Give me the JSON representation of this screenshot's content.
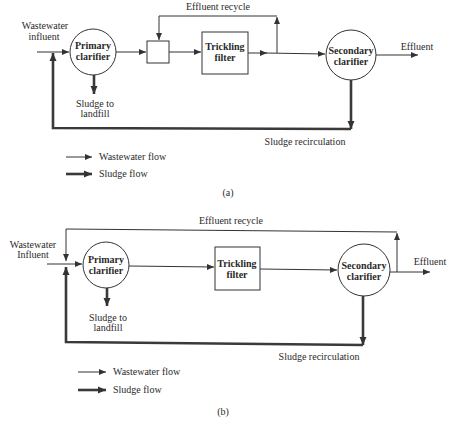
{
  "colors": {
    "line": "#333333",
    "sludge_line": "#3a3a3a",
    "text": "#2a2a2a",
    "background": "#ffffff"
  },
  "panel_a": {
    "influent": [
      "Wastewater",
      "influent"
    ],
    "primary_clarifier": [
      "Primary",
      "clarifier"
    ],
    "trickling_filter": [
      "Trickling",
      "filter"
    ],
    "secondary_clarifier": [
      "Secondary",
      "clarifier"
    ],
    "effluent": "Effluent",
    "effluent_recycle": "Effluent recycle",
    "sludge_to_landfill": [
      "Sludge to",
      "landfill"
    ],
    "sludge_recirculation": "Sludge recirculation",
    "legend": {
      "wastewater_flow": "Wastewater flow",
      "sludge_flow": "Sludge flow"
    },
    "caption": "(a)"
  },
  "panel_b": {
    "influent": [
      "Wastewater",
      "Influent"
    ],
    "primary_clarifier": [
      "Primary",
      "clarifier"
    ],
    "trickling_filter": [
      "Trickling",
      "filter"
    ],
    "secondary_clarifier": [
      "Secondary",
      "clarifier"
    ],
    "effluent": "Effluent",
    "effluent_recycle": "Effluent recycle",
    "sludge_to_landfill": [
      "Sludge to",
      "landfill"
    ],
    "sludge_recirculation": "Sludge recirculation",
    "legend": {
      "wastewater_flow": "Wastewater flow",
      "sludge_flow": "Sludge flow"
    },
    "caption": "(b)"
  }
}
